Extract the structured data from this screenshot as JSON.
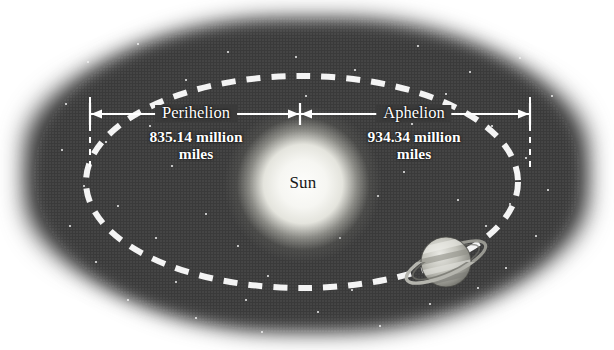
{
  "diagram": {
    "type": "orbital-diagram"
  },
  "sun": {
    "label": "Sun",
    "cx": 303,
    "cy": 184,
    "radius": 49,
    "color": "#f7f7f3",
    "label_color": "#171717"
  },
  "orbit": {
    "cx": 302,
    "cy": 182,
    "rx": 216,
    "ry": 106,
    "style": "dashed",
    "color": "#f4f4f4",
    "dash": "14 11",
    "width": 6
  },
  "planet": {
    "name": "planet-saturn",
    "cx": 446,
    "cy": 262,
    "radius": 25,
    "has_rings": true,
    "ring_tilt_deg": -24,
    "color": "#b9b9b2"
  },
  "measurements": {
    "line_y": 114,
    "color": "#ffffff",
    "left": {
      "title": "Perihelion",
      "value": "835.14 million",
      "unit": "miles",
      "x_start": 90,
      "x_end": 300,
      "label_cx": 196
    },
    "right": {
      "title": "Aphelion",
      "value": "934.34 million",
      "unit": "miles",
      "x_start": 300,
      "x_end": 530,
      "label_cx": 414
    }
  },
  "background": {
    "space_color": "#3a3a3a",
    "page_color": "#ffffff",
    "star_color": "#f2f2f2"
  },
  "stars": [
    {
      "x": 88,
      "y": 62,
      "r": 1.3
    },
    {
      "x": 138,
      "y": 44,
      "r": 1.2
    },
    {
      "x": 186,
      "y": 80,
      "r": 1.1
    },
    {
      "x": 228,
      "y": 52,
      "r": 1.4
    },
    {
      "x": 296,
      "y": 57,
      "r": 1.2
    },
    {
      "x": 355,
      "y": 70,
      "r": 1.1
    },
    {
      "x": 418,
      "y": 46,
      "r": 1.3
    },
    {
      "x": 470,
      "y": 72,
      "r": 1.2
    },
    {
      "x": 520,
      "y": 58,
      "r": 1.1
    },
    {
      "x": 552,
      "y": 96,
      "r": 1.2
    },
    {
      "x": 66,
      "y": 104,
      "r": 1.2
    },
    {
      "x": 62,
      "y": 150,
      "r": 1.1
    },
    {
      "x": 84,
      "y": 186,
      "r": 1.3
    },
    {
      "x": 70,
      "y": 226,
      "r": 1.1
    },
    {
      "x": 96,
      "y": 262,
      "r": 1.2
    },
    {
      "x": 128,
      "y": 300,
      "r": 1.2
    },
    {
      "x": 176,
      "y": 282,
      "r": 1.1
    },
    {
      "x": 196,
      "y": 318,
      "r": 1.2
    },
    {
      "x": 246,
      "y": 300,
      "r": 1.1
    },
    {
      "x": 262,
      "y": 332,
      "r": 1.2
    },
    {
      "x": 318,
      "y": 312,
      "r": 1.3
    },
    {
      "x": 352,
      "y": 290,
      "r": 1.1
    },
    {
      "x": 380,
      "y": 326,
      "r": 1.2
    },
    {
      "x": 430,
      "y": 304,
      "r": 1.1
    },
    {
      "x": 478,
      "y": 288,
      "r": 1.3
    },
    {
      "x": 506,
      "y": 268,
      "r": 1.2
    },
    {
      "x": 536,
      "y": 236,
      "r": 1.1
    },
    {
      "x": 548,
      "y": 190,
      "r": 1.2
    },
    {
      "x": 526,
      "y": 158,
      "r": 1.1
    },
    {
      "x": 492,
      "y": 126,
      "r": 1.2
    },
    {
      "x": 150,
      "y": 126,
      "r": 1.1
    },
    {
      "x": 118,
      "y": 206,
      "r": 1.2
    },
    {
      "x": 206,
      "y": 214,
      "r": 1.1
    },
    {
      "x": 238,
      "y": 246,
      "r": 1.2
    },
    {
      "x": 378,
      "y": 196,
      "r": 1.1
    },
    {
      "x": 404,
      "y": 172,
      "r": 1.2
    },
    {
      "x": 458,
      "y": 200,
      "r": 1.1
    },
    {
      "x": 486,
      "y": 226,
      "r": 1.2
    },
    {
      "x": 172,
      "y": 166,
      "r": 1.1
    },
    {
      "x": 340,
      "y": 238,
      "r": 1.1
    },
    {
      "x": 412,
      "y": 124,
      "r": 1.2
    },
    {
      "x": 268,
      "y": 276,
      "r": 1.1
    },
    {
      "x": 156,
      "y": 238,
      "r": 1.2
    },
    {
      "x": 106,
      "y": 142,
      "r": 1.1
    },
    {
      "x": 446,
      "y": 94,
      "r": 1.1
    },
    {
      "x": 306,
      "y": 96,
      "r": 1.0
    },
    {
      "x": 222,
      "y": 118,
      "r": 1.0
    },
    {
      "x": 510,
      "y": 204,
      "r": 1.1
    }
  ]
}
